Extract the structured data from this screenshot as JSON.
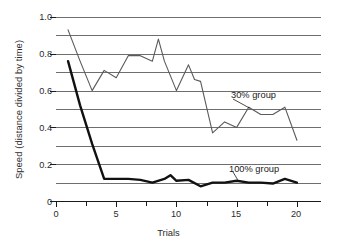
{
  "chart_data": {
    "type": "line",
    "title": "",
    "xlabel": "Trials",
    "ylabel": "Speed (distance divided by time)",
    "xlim": [
      0,
      22
    ],
    "ylim": [
      0,
      1.0
    ],
    "x_ticks": [
      "0",
      "5",
      "10",
      "15",
      "20"
    ],
    "x_tick_values": [
      0,
      5,
      10,
      15,
      20
    ],
    "x_minor_tick_values": [
      2.5,
      7.5,
      12.5,
      17.5
    ],
    "y_ticks": [
      "0",
      "0.2",
      "0.4",
      "0.6",
      "0.8",
      "1.0"
    ],
    "y_tick_values": [
      0,
      0.2,
      0.4,
      0.6,
      0.8,
      1.0
    ],
    "gridlines": {
      "horizontal": true,
      "vertical": false,
      "y_values": [
        0.1,
        0.2,
        0.3,
        0.4,
        0.5,
        0.6,
        0.7,
        0.8,
        0.9,
        1.0
      ],
      "color": "#6e6e6e"
    },
    "legend_position": "inline-annotation",
    "series": [
      {
        "name": "30% group",
        "color": "#5a5a5a",
        "line_width": 1.1,
        "annotation": "30% group",
        "x": [
          1,
          2,
          3,
          4,
          5,
          6,
          7,
          8,
          8.5,
          9,
          10,
          11,
          11.5,
          12,
          13,
          14,
          15,
          16,
          17,
          18,
          19,
          20
        ],
        "values": [
          0.93,
          0.76,
          0.6,
          0.71,
          0.67,
          0.79,
          0.79,
          0.76,
          0.88,
          0.76,
          0.6,
          0.74,
          0.66,
          0.65,
          0.37,
          0.43,
          0.4,
          0.51,
          0.47,
          0.47,
          0.51,
          0.33
        ]
      },
      {
        "name": "100% group",
        "color": "#111111",
        "line_width": 2.4,
        "annotation": "100% group",
        "x": [
          1,
          2,
          3,
          4,
          5,
          6,
          7,
          8,
          9,
          9.5,
          10,
          11,
          12,
          13,
          14,
          15,
          16,
          17,
          18,
          19,
          20
        ],
        "values": [
          0.76,
          0.52,
          0.31,
          0.12,
          0.12,
          0.12,
          0.115,
          0.1,
          0.12,
          0.14,
          0.11,
          0.115,
          0.08,
          0.1,
          0.1,
          0.11,
          0.1,
          0.1,
          0.095,
          0.12,
          0.1
        ]
      }
    ],
    "annotations": [
      {
        "label": "30% group",
        "target_series": "30% group",
        "target_x": 16,
        "target_y": 0.51
      },
      {
        "label": "100% group",
        "target_series": "100% group",
        "target_x": 15,
        "target_y": 0.11
      }
    ]
  },
  "axis": {
    "y_title": "Speed (distance divided by time)",
    "x_title": "Trials",
    "y_labels": [
      "1.0",
      "0.8",
      "0.6",
      "0.4",
      "0.2",
      "0"
    ],
    "x_labels": [
      "0",
      "5",
      "10",
      "15",
      "20"
    ]
  },
  "labels": {
    "group_30": "30% group",
    "group_100": "100% group"
  },
  "colors": {
    "background": "#ffffff",
    "grid": "#6e6e6e",
    "axis": "#1a1a1a",
    "series_30": "#5a5a5a",
    "series_100": "#111111",
    "text": "#2b2b2b"
  }
}
